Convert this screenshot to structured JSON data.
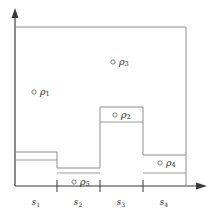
{
  "figure": {
    "background_color": "#ffffff",
    "outline_color": "#8e8e8e",
    "axis_color": "#3b3b3b",
    "marker_stroke_color": "#6f6f6f",
    "text_color": "#2e2e2e"
  },
  "axes": {
    "x_axis_name": "horizontal-axis",
    "y_axis_name": "vertical-axis",
    "x_origin": 15,
    "y_origin": 186,
    "x_end": 207,
    "y_end": 10,
    "has_arrow_heads": true
  },
  "ticks": [
    {
      "label": "s",
      "sub": "1",
      "center_x": 36,
      "boundary_x": 57
    },
    {
      "label": "s",
      "sub": "2",
      "center_x": 78,
      "boundary_x": 100
    },
    {
      "label": "s",
      "sub": "3",
      "center_x": 121,
      "boundary_x": 143
    },
    {
      "label": "s",
      "sub": "4",
      "center_x": 164,
      "boundary_x": 186
    }
  ],
  "tick_label_y": 202,
  "outer_rectangle": {
    "name": "bounding-rectangle",
    "left": 15,
    "top": 27,
    "right": 186,
    "bottom": 186
  },
  "step_profile": {
    "name": "step-function-outline",
    "description": "Piecewise constant lower profile across the four segments",
    "segments": [
      {
        "segment": "s1",
        "x_start": 15,
        "x_end": 57,
        "top_y": 152
      },
      {
        "segment": "s2",
        "x_start": 57,
        "x_end": 100,
        "top_y": 168
      },
      {
        "segment": "s3",
        "x_start": 100,
        "x_end": 143,
        "top_y": 107
      },
      {
        "segment": "s4",
        "x_start": 143,
        "x_end": 186,
        "top_y": 155
      }
    ],
    "baseline_y": 186
  },
  "inner_lines": [
    {
      "name": "inner-line-s1",
      "x_start": 15,
      "x_end": 57,
      "y": 160
    },
    {
      "name": "inner-line-s2",
      "x_start": 57,
      "x_end": 100,
      "y": 173
    },
    {
      "name": "inner-line-s3",
      "x_start": 100,
      "x_end": 143,
      "y": 122
    },
    {
      "name": "inner-line-s4",
      "x_start": 143,
      "x_end": 186,
      "y": 173
    }
  ],
  "rho_points": [
    {
      "name": "rho-1",
      "label": "ρ",
      "sub": "1",
      "marker_x": 34,
      "marker_y": 92,
      "label_x": 40,
      "label_y": 92
    },
    {
      "name": "rho-2",
      "label": "ρ",
      "sub": "2",
      "marker_x": 115,
      "marker_y": 115,
      "label_x": 121,
      "label_y": 115
    },
    {
      "name": "rho-3",
      "label": "ρ",
      "sub": "3",
      "marker_x": 113,
      "marker_y": 62,
      "label_x": 119,
      "label_y": 62
    },
    {
      "name": "rho-4",
      "label": "ρ",
      "sub": "4",
      "marker_x": 160,
      "marker_y": 163,
      "label_x": 166,
      "label_y": 163
    },
    {
      "name": "rho-5",
      "label": "ρ",
      "sub": "5",
      "marker_x": 74,
      "marker_y": 182,
      "label_x": 80,
      "label_y": 182
    }
  ]
}
